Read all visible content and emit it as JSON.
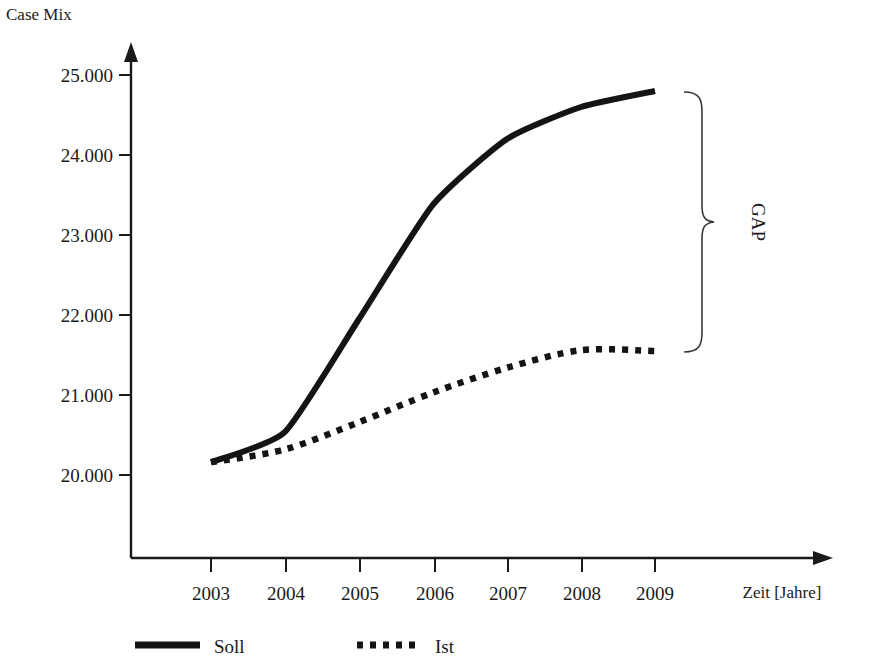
{
  "chart_data": {
    "type": "line",
    "title": "Case Mix",
    "xlabel": "Zeit [Jahre]",
    "ylabel": "Case Mix",
    "categories": [
      "2003",
      "2004",
      "2005",
      "2006",
      "2007",
      "2008",
      "2009"
    ],
    "x": [
      2003,
      2004,
      2005,
      2006,
      2007,
      2008,
      2009
    ],
    "xlim": [
      2002.6,
      2009.6
    ],
    "ylim": [
      19500,
      25200
    ],
    "ytick_labels": [
      "25.000",
      "24.000",
      "23.000",
      "22.000",
      "21.000",
      "20.000"
    ],
    "ytick_values": [
      25000,
      24000,
      23000,
      22000,
      21000,
      20000
    ],
    "grid": false,
    "legend_position": "bottom",
    "series": [
      {
        "name": "Soll",
        "style": "solid",
        "values": [
          20160,
          20540,
          21950,
          23380,
          24200,
          24600,
          24800
        ]
      },
      {
        "name": "Ist",
        "style": "dotted",
        "values": [
          20160,
          20320,
          20660,
          21030,
          21340,
          21560,
          21550
        ]
      }
    ],
    "annotations": [
      {
        "text": "GAP",
        "type": "brace",
        "rotation": 90,
        "spans": [
          "Soll 2009",
          "Ist 2009"
        ]
      }
    ]
  },
  "axes": {
    "y_title": "Case Mix",
    "x_title": "Zeit [Jahre]",
    "y_ticks": [
      {
        "label": "25.000"
      },
      {
        "label": "24.000"
      },
      {
        "label": "23.000"
      },
      {
        "label": "22.000"
      },
      {
        "label": "21.000"
      },
      {
        "label": "20.000"
      }
    ],
    "x_ticks": [
      {
        "label": "2003"
      },
      {
        "label": "2004"
      },
      {
        "label": "2005"
      },
      {
        "label": "2006"
      },
      {
        "label": "2007"
      },
      {
        "label": "2008"
      },
      {
        "label": "2009"
      }
    ]
  },
  "legend": {
    "entries": [
      {
        "label": "Soll",
        "style": "solid"
      },
      {
        "label": "Ist",
        "style": "dotted"
      }
    ]
  },
  "annotation": {
    "gap_label": "GAP"
  },
  "colors": {
    "ink": "#141414",
    "axis": "#1a1a1a",
    "brace": "#3a3a3a",
    "background": "#ffffff"
  }
}
